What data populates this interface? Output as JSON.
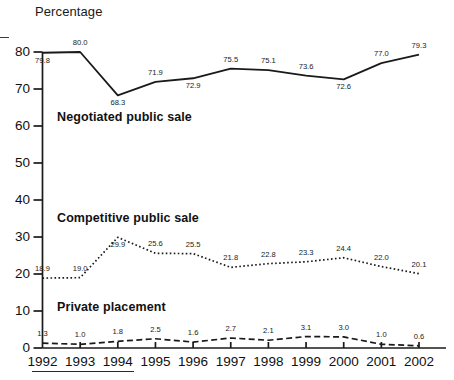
{
  "chart_data": {
    "type": "line",
    "title": "",
    "ylabel": "Percentage",
    "xlabel": "",
    "ylim": [
      0,
      80
    ],
    "ytick_step": 10,
    "grid": false,
    "legend": "inline-annotations",
    "categories": [
      "1992",
      "1993",
      "1994",
      "1995",
      "1996",
      "1997",
      "1998",
      "1999",
      "2000",
      "2001",
      "2002"
    ],
    "yticks": [
      "0",
      "10",
      "20",
      "30",
      "40",
      "50",
      "60",
      "70",
      "80"
    ],
    "series": [
      {
        "name": "Negotiated public sale",
        "style": "solid",
        "values": [
          79.8,
          80.0,
          68.3,
          71.9,
          72.9,
          75.5,
          75.1,
          73.6,
          72.6,
          77.0,
          79.3
        ],
        "labels": [
          "79.8",
          "80.0",
          "68.3",
          "71.9",
          "72.9",
          "75.5",
          "75.1",
          "73.6",
          "72.6",
          "77.0",
          "79.3"
        ],
        "label_side": [
          "below",
          "above",
          "below",
          "above",
          "below",
          "above",
          "above",
          "above",
          "below",
          "above",
          "above"
        ]
      },
      {
        "name": "Competitive public sale",
        "style": "dotted",
        "values": [
          18.9,
          19.0,
          29.9,
          25.6,
          25.5,
          21.8,
          22.8,
          23.3,
          24.4,
          22.0,
          20.1
        ],
        "labels": [
          "18.9",
          "19.0",
          "29.9",
          "25.6",
          "25.5",
          "21.8",
          "22.8",
          "23.3",
          "24.4",
          "22.0",
          "20.1"
        ],
        "label_side": [
          "above",
          "above",
          "below",
          "above",
          "above",
          "above",
          "above",
          "above",
          "above",
          "above",
          "above"
        ]
      },
      {
        "name": "Private placement",
        "style": "dashed",
        "values": [
          1.3,
          1.0,
          1.8,
          2.5,
          1.6,
          2.7,
          2.1,
          3.1,
          3.0,
          1.0,
          0.6
        ],
        "labels": [
          "1.3",
          "1.0",
          "1.8",
          "2.5",
          "1.6",
          "2.7",
          "2.1",
          "3.1",
          "3.0",
          "1.0",
          "0.6"
        ],
        "label_side": [
          "above",
          "above",
          "above",
          "above",
          "above",
          "above",
          "above",
          "above",
          "above",
          "above",
          "above"
        ]
      }
    ],
    "series_label_positions": [
      {
        "name": "Negotiated public sale",
        "x": 57,
        "y": 110
      },
      {
        "name": "Competitive public sale",
        "x": 57,
        "y": 211
      },
      {
        "name": "Private placement",
        "x": 57,
        "y": 300
      }
    ],
    "colors": {
      "line": "#1a1a1a",
      "axis": "#1a1a1a",
      "text": "#111111",
      "background": "#ffffff"
    }
  }
}
